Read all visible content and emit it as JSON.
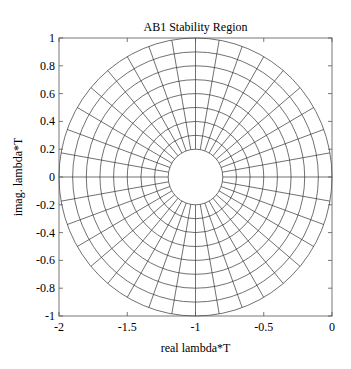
{
  "chart_data": {
    "type": "line",
    "title": "AB1 Stability Region",
    "xlabel": "real lambda*T",
    "ylabel": "imag. lambda*T",
    "xlim": [
      -2,
      0
    ],
    "ylim": [
      -1,
      1
    ],
    "xticks": [
      -2,
      -1.5,
      -1,
      -0.5,
      0
    ],
    "xtick_labels": [
      "-2",
      "-1.5",
      "-1",
      "-0.5",
      "0"
    ],
    "yticks": [
      1,
      0.8,
      0.6,
      0.4,
      0.2,
      0,
      -0.2,
      -0.4,
      -0.6,
      -0.8,
      -1
    ],
    "ytick_labels": [
      "1",
      "0.8",
      "0.6",
      "0.4",
      "0.2",
      "0",
      "-0.2",
      "-0.4",
      "-0.6",
      "-0.8",
      "-1"
    ],
    "grid": false,
    "legend": null,
    "polar_grid": {
      "center": [
        -1,
        0
      ],
      "ring_radii": [
        0.2,
        0.3,
        0.4,
        0.5,
        0.6,
        0.7,
        0.8,
        0.9,
        1.0
      ],
      "inner_radius": 0.2,
      "outer_radius": 1.0,
      "spoke_angle_step_deg": 10,
      "spoke_count": 36
    }
  },
  "colors": {
    "background": "#ffffff",
    "line": "#333333",
    "axis": "#555555",
    "text": "#000000"
  }
}
